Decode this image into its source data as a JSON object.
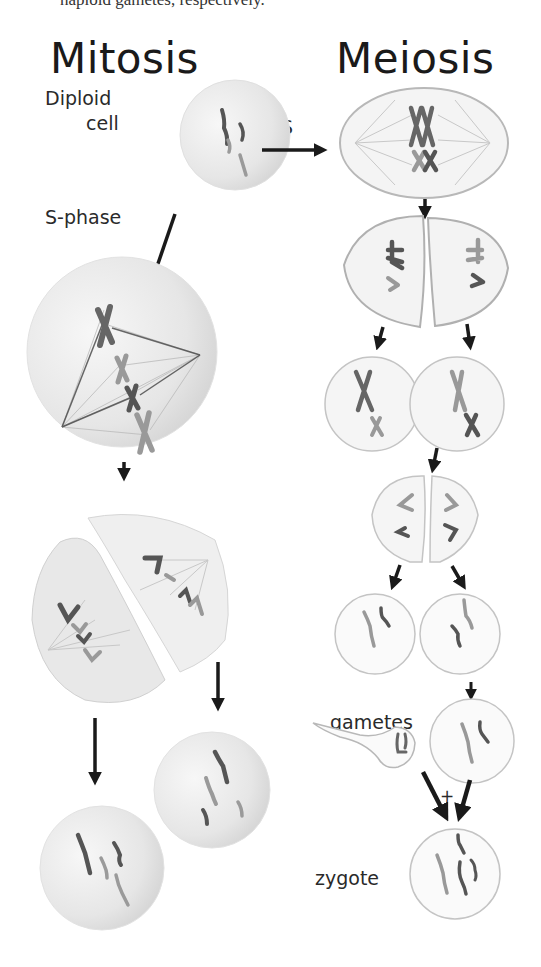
{
  "caption": "haploid gametes, respectively.",
  "titles": {
    "mitosis": "Mitosis",
    "meiosis": "Meiosis"
  },
  "labels": {
    "diploid_line1": "Diploid",
    "diploid_line2": "cell",
    "s_phase": "S-phase",
    "s": "S",
    "gametes": "gametes",
    "zygote": "zygote",
    "plus": "+"
  },
  "stages": {
    "mitosis": [
      "Diploid cell",
      "S-phase",
      "Metaphase",
      "Anaphase/Telophase",
      "Two diploid daughter cells"
    ],
    "meiosis": [
      "S",
      "Meiosis I metaphase",
      "Meiosis I telophase",
      "Meiosis II metaphase",
      "Meiosis II telophase",
      "Haploid gametes",
      "Fertilization (sperm + egg)",
      "Zygote"
    ]
  },
  "colors": {
    "cell_fill": "#ececec",
    "cell_outline": "#bdbdbd",
    "chrom_dark": "#555555",
    "chrom_light": "#9a9a9a",
    "arrow": "#1a1a1a",
    "text": "#1a1a1a"
  }
}
